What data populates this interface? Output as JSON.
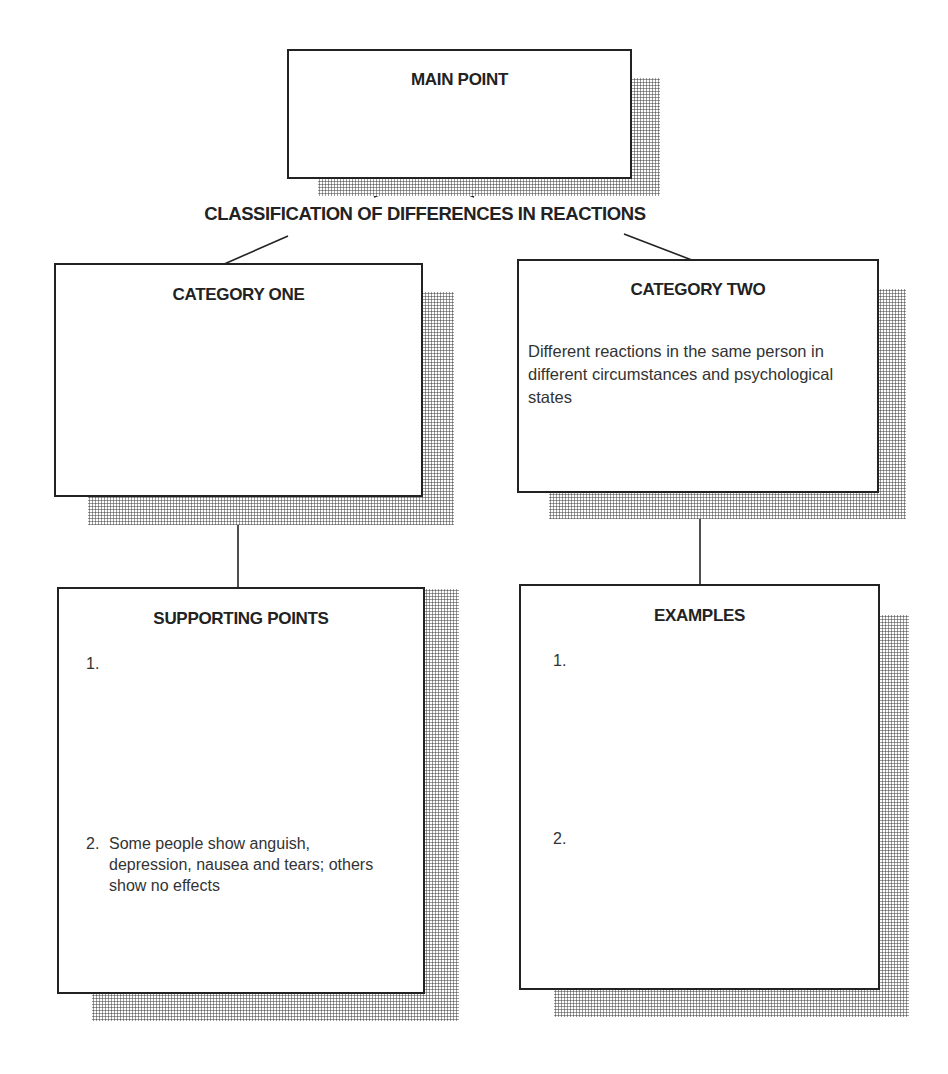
{
  "diagram": {
    "title": "CLASSIFICATION OF DIFFERENCES IN REACTIONS",
    "main_point": {
      "title": "MAIN POINT",
      "body": ""
    },
    "category_one": {
      "title": "CATEGORY ONE",
      "body": ""
    },
    "category_two": {
      "title": "CATEGORY TWO",
      "body": "Different reactions in the same person in different circumstances and psychological states"
    },
    "supporting_points": {
      "title": "SUPPORTING POINTS",
      "items": [
        {
          "num": "1.",
          "text": ""
        },
        {
          "num": "2.",
          "text": "Some people show anguish, depression, nausea and tears; others show no effects"
        }
      ]
    },
    "examples": {
      "title": "EXAMPLES",
      "items": [
        {
          "num": "1.",
          "text": ""
        },
        {
          "num": "2.",
          "text": ""
        }
      ]
    },
    "colors": {
      "line": "#222222",
      "shadow_dots": "#6a6a6a",
      "background": "#ffffff"
    }
  }
}
